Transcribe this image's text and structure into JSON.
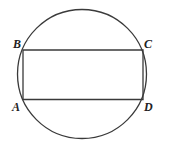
{
  "figure": {
    "width": 169,
    "height": 147,
    "stroke_color": "#3a3a3a",
    "circle": {
      "cx": 82,
      "cy": 74,
      "r": 64.5
    },
    "rectangle": {
      "vertices": {
        "A": {
          "x": 23,
          "y": 99.5
        },
        "B": {
          "x": 23,
          "y": 50
        },
        "C": {
          "x": 143,
          "y": 50
        },
        "D": {
          "x": 143,
          "y": 99.5
        }
      }
    },
    "labels": [
      {
        "text": "B",
        "x": 13,
        "y": 38
      },
      {
        "text": "C",
        "x": 144,
        "y": 38
      },
      {
        "text": "A",
        "x": 12,
        "y": 101
      },
      {
        "text": "D",
        "x": 144,
        "y": 101
      }
    ]
  }
}
